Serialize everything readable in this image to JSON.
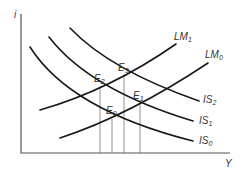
{
  "diagram": {
    "axes": {
      "y_label": "i",
      "x_label": "Y"
    },
    "curves": {
      "IS0": {
        "base": "IS",
        "sub": "0"
      },
      "IS1": {
        "base": "IS",
        "sub": "1"
      },
      "IS2": {
        "base": "IS",
        "sub": "2"
      },
      "LM0": {
        "base": "LM",
        "sub": "0"
      },
      "LM1": {
        "base": "LM",
        "sub": "1"
      }
    },
    "equilibria": {
      "E0": {
        "base": "E",
        "sub": "0"
      },
      "E1": {
        "base": "E",
        "sub": "1"
      },
      "E2": {
        "base": "E",
        "sub": "2"
      },
      "E3": {
        "base": "E",
        "sub": "3"
      }
    },
    "colors": {
      "curve": "#1a1a1a",
      "axis": "#555555",
      "text": "#333333"
    }
  }
}
